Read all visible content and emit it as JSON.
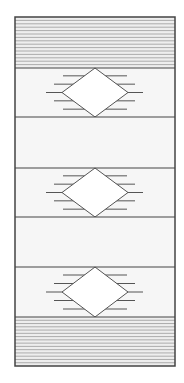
{
  "figure": {
    "colors": {
      "page_background": "#ffffff",
      "frame_stroke": "#444444",
      "panel_fill": "#f6f6f6",
      "stripe_fill": "#eeeeee",
      "stripe_line": "#9a9a9a",
      "diamond_fill": "#ffffff",
      "diamond_stroke": "#555555",
      "ray_line": "#555555"
    },
    "frame": {
      "x": 15,
      "y": 17,
      "width": 160,
      "height": 349
    },
    "bands": [
      {
        "type": "striped",
        "y0": 17,
        "y1": 68,
        "stripe_count": 14
      },
      {
        "type": "diamond",
        "y0": 68,
        "y1": 117
      },
      {
        "type": "plain",
        "y0": 117,
        "y1": 168
      },
      {
        "type": "diamond",
        "y0": 168,
        "y1": 217
      },
      {
        "type": "plain",
        "y0": 217,
        "y1": 267
      },
      {
        "type": "diamond",
        "y0": 267,
        "y1": 317
      },
      {
        "type": "striped",
        "y0": 317,
        "y1": 366,
        "stripe_count": 14
      }
    ],
    "diamond": {
      "center_x": 95,
      "half_width": 33,
      "rays": [
        {
          "dy": -0.34,
          "x0": 63,
          "x1": 127
        },
        {
          "dy": -0.17,
          "x0": 54,
          "x1": 135
        },
        {
          "dy": 0,
          "x0": 46,
          "x1": 143
        },
        {
          "dy": 0.17,
          "x0": 54,
          "x1": 135
        },
        {
          "dy": 0.34,
          "x0": 63,
          "x1": 127
        }
      ]
    }
  }
}
